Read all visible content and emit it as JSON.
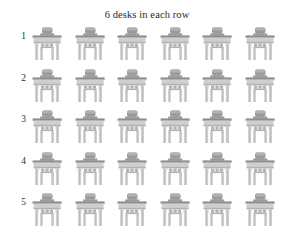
{
  "chart_data": {
    "type": "table",
    "title": "6 desks in each row",
    "xlabel": "",
    "ylabel": "",
    "categories": [
      "1",
      "2",
      "3",
      "4",
      "5"
    ],
    "values": [
      6,
      6,
      6,
      6,
      6
    ],
    "item_icon": "desk-icon",
    "rows": 5,
    "columns": 6,
    "total": 30,
    "grid": false,
    "legend": false,
    "colors": {
      "background": "#ffffff",
      "text": "#2b2b2b",
      "desk_light": "#cfcfcf",
      "desk_mid": "#b2b2b2",
      "desk_dark": "#9a9a9a",
      "desk_edge": "#8d8d8d"
    }
  },
  "title": "6 desks in each row",
  "rows": [
    {
      "label": "1",
      "desks": [
        "desk",
        "desk",
        "desk",
        "desk",
        "desk",
        "desk"
      ]
    },
    {
      "label": "2",
      "desks": [
        "desk",
        "desk",
        "desk",
        "desk",
        "desk",
        "desk"
      ]
    },
    {
      "label": "3",
      "desks": [
        "desk",
        "desk",
        "desk",
        "desk",
        "desk",
        "desk"
      ]
    },
    {
      "label": "4",
      "desks": [
        "desk",
        "desk",
        "desk",
        "desk",
        "desk",
        "desk"
      ]
    },
    {
      "label": "5",
      "desks": [
        "desk",
        "desk",
        "desk",
        "desk",
        "desk",
        "desk"
      ]
    }
  ]
}
